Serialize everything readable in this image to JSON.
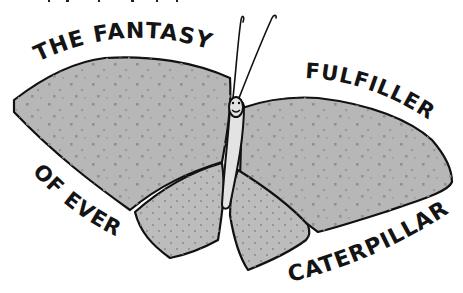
{
  "illustration": {
    "subject": "hand-drawn butterfly",
    "colors": {
      "background": "#ffffff",
      "wing_fill": "#b3b3b3",
      "wing_fill_light": "#c4c4c4",
      "body_fill": "#e2e2e2",
      "outline": "#111111",
      "dots": "#8d8d8d"
    },
    "captions": [
      {
        "id": "top-left",
        "text": "THE FANTASY"
      },
      {
        "id": "top-right",
        "text": "FULFILLER"
      },
      {
        "id": "bottom-left",
        "text": "OF EVERY"
      },
      {
        "id": "bottom-right",
        "text": "CATERPILLAR"
      }
    ]
  }
}
